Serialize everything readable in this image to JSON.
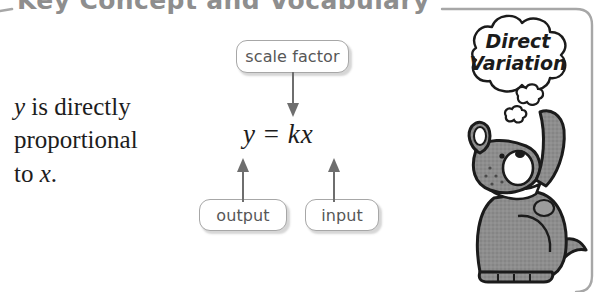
{
  "callout": {
    "heading": "Key Concept and Vocabulary",
    "heading_color": "#8e8e8e",
    "border_color": "#a7a7a7",
    "background_color": "#ffffff"
  },
  "statement": {
    "line1_var": "y",
    "line1_text": " is directly",
    "line2_text": "proportional",
    "line3_text": "to ",
    "line3_var": "x",
    "line3_period": "."
  },
  "equation": {
    "lhs": "y",
    "operator": " = ",
    "coefficient": "k",
    "variable": "x"
  },
  "labels": {
    "scale_factor": "scale factor",
    "output": "output",
    "input": "input"
  },
  "thought_bubble": {
    "line1": "Direct",
    "line2": "Variation",
    "text_color": "#1b1b1b"
  },
  "mascot": {
    "name": "dog",
    "body_color": "#8a8a8a",
    "outline_color": "#1b1b1b",
    "collar_color": "#ffffff"
  }
}
